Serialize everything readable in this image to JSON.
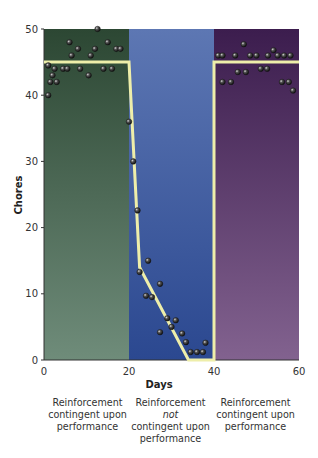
{
  "chart_data": {
    "type": "scatter",
    "title": "",
    "xlabel": "Days",
    "ylabel": "Chores",
    "xlim": [
      0,
      60
    ],
    "ylim": [
      0,
      50
    ],
    "xticks": [
      0,
      20,
      40,
      60
    ],
    "yticks": [
      0,
      10,
      20,
      30,
      40,
      50
    ],
    "grid": false,
    "phases": [
      {
        "x_start": 0,
        "x_end": 20,
        "label": "Reinforcement contingent upon performance",
        "color_top": "#2c4733",
        "color_bottom": "#6f8c7a"
      },
      {
        "x_start": 20,
        "x_end": 40,
        "label": "Reinforcement not contingent upon performance",
        "color_top": "#5d77b3",
        "color_bottom": "#2b4890"
      },
      {
        "x_start": 40,
        "x_end": 60,
        "label": "Reinforcement contingent upon performance",
        "color_top": "#3c1d4e",
        "color_bottom": "#82628f"
      }
    ],
    "trend_line": {
      "color": "#eeeeaa",
      "points": [
        [
          0,
          45
        ],
        [
          20,
          45
        ],
        [
          22.5,
          14
        ],
        [
          34,
          0
        ],
        [
          40,
          0
        ],
        [
          40,
          45
        ],
        [
          60,
          45
        ]
      ]
    },
    "series": [
      {
        "name": "Chores completed",
        "points": [
          [
            12.6,
            50
          ],
          [
            6,
            48
          ],
          [
            15,
            48
          ],
          [
            8,
            47
          ],
          [
            12,
            47
          ],
          [
            17,
            47
          ],
          [
            18,
            47
          ],
          [
            6.5,
            46
          ],
          [
            11,
            46
          ],
          [
            1,
            44.5
          ],
          [
            2.5,
            44
          ],
          [
            4.5,
            44
          ],
          [
            5.5,
            44
          ],
          [
            8.5,
            44
          ],
          [
            14,
            44
          ],
          [
            16,
            44
          ],
          [
            2,
            43
          ],
          [
            10.5,
            43
          ],
          [
            1.5,
            42
          ],
          [
            3,
            42
          ],
          [
            1,
            40
          ],
          [
            20,
            36
          ],
          [
            21,
            30
          ],
          [
            22,
            22.6
          ],
          [
            24.5,
            15
          ],
          [
            22.5,
            13.3
          ],
          [
            27.3,
            11.5
          ],
          [
            24,
            9.7
          ],
          [
            25.4,
            9.5
          ],
          [
            29,
            6.3
          ],
          [
            31,
            6
          ],
          [
            30,
            5
          ],
          [
            27.3,
            4.2
          ],
          [
            32.5,
            4
          ],
          [
            33.4,
            2.7
          ],
          [
            38,
            2.6
          ],
          [
            34.5,
            1.2
          ],
          [
            36,
            1.2
          ],
          [
            37.4,
            1.2
          ],
          [
            47,
            47.7
          ],
          [
            54,
            46.8
          ],
          [
            41,
            46
          ],
          [
            42,
            46
          ],
          [
            45,
            46
          ],
          [
            48.5,
            46
          ],
          [
            50,
            46
          ],
          [
            52.7,
            46
          ],
          [
            55,
            46
          ],
          [
            56.5,
            46
          ],
          [
            58,
            46
          ],
          [
            51,
            44
          ],
          [
            52.5,
            44
          ],
          [
            45.6,
            43.5
          ],
          [
            47.5,
            43.5
          ],
          [
            42,
            42
          ],
          [
            44,
            42
          ],
          [
            56,
            42
          ],
          [
            57.6,
            42
          ],
          [
            58.6,
            40.7
          ]
        ]
      }
    ]
  },
  "labels": {
    "xlabel": "Days",
    "ylabel": "Chores",
    "phase1": [
      "Reinforcement",
      "contingent upon",
      "performance"
    ],
    "phase2": [
      "Reinforcement",
      "not",
      "contingent upon",
      "performance"
    ],
    "phase3": [
      "Reinforcement",
      "contingent upon",
      "performance"
    ]
  }
}
